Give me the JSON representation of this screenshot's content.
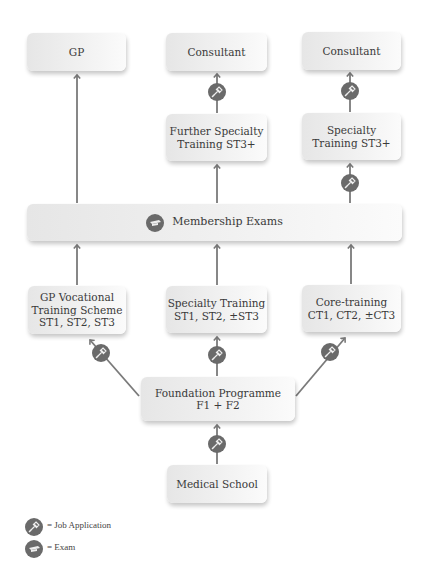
{
  "diagram": {
    "nodes": {
      "gp": {
        "lines": [
          "GP"
        ]
      },
      "consultant_mid": {
        "lines": [
          "Consultant"
        ]
      },
      "consultant_right": {
        "lines": [
          "Consultant"
        ]
      },
      "further_specialty": {
        "lines": [
          "Further Specialty",
          "Training ST3+"
        ]
      },
      "specialty_st3": {
        "lines": [
          "Specialty",
          "Training ST3+"
        ]
      },
      "membership": {
        "lines": [
          "Membership Exams"
        ],
        "icon": "exam-icon"
      },
      "gp_vts": {
        "lines": [
          "GP Vocational",
          "Training Scheme",
          "ST1, ST2, ST3"
        ]
      },
      "specialty_training": {
        "lines": [
          "Specialty Training",
          "ST1, ST2, ±ST3"
        ]
      },
      "core_training": {
        "lines": [
          "Core-training",
          "CT1, CT2, ±CT3"
        ]
      },
      "foundation": {
        "lines": [
          "Foundation Programme",
          "F1 + F2"
        ]
      },
      "medical_school": {
        "lines": [
          "Medical School"
        ]
      }
    },
    "edges": [
      {
        "from": "medical_school",
        "to": "foundation",
        "via": "job-application-icon"
      },
      {
        "from": "foundation",
        "to": "gp_vts",
        "via": "job-application-icon"
      },
      {
        "from": "foundation",
        "to": "specialty_training",
        "via": "job-application-icon"
      },
      {
        "from": "foundation",
        "to": "core_training",
        "via": "job-application-icon"
      },
      {
        "from": "gp_vts",
        "to": "membership"
      },
      {
        "from": "specialty_training",
        "to": "membership"
      },
      {
        "from": "core_training",
        "to": "membership"
      },
      {
        "from": "membership",
        "to": "gp"
      },
      {
        "from": "membership",
        "to": "further_specialty"
      },
      {
        "from": "membership",
        "to": "specialty_st3",
        "via": "job-application-icon"
      },
      {
        "from": "further_specialty",
        "to": "consultant_mid",
        "via": "job-application-icon"
      },
      {
        "from": "specialty_st3",
        "to": "consultant_right",
        "via": "job-application-icon"
      }
    ],
    "colors": {
      "line": "#7a7a7a",
      "icon": "#6a6a6a",
      "box_left": "#e6e6e6",
      "box_right": "#fbfbfb"
    }
  },
  "legend": {
    "job_application": "= Job Application",
    "exam": "= Exam"
  }
}
